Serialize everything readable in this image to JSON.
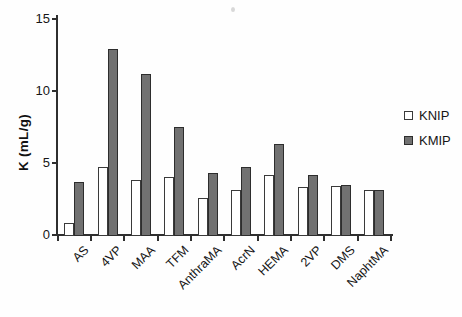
{
  "figure": {
    "background": "#fefefe",
    "kind": "scanned scientific bar chart"
  },
  "colors": {
    "axis": "#2f2f2f",
    "text": "#161616",
    "knip_fill": "#ffffff",
    "knip_border": "#3a3a3a",
    "kmip_fill": "#717171",
    "kmip_border": "#2d2d2d"
  },
  "chart_data": {
    "type": "bar",
    "title": "",
    "xlabel": "",
    "ylabel": "K (mL/g)",
    "ylim": [
      0,
      15
    ],
    "yticks": [
      0,
      5,
      10,
      15
    ],
    "grid": false,
    "legend_position": "right",
    "categories": [
      "AS",
      "4VP",
      "MAA",
      "TFM",
      "AnthraMA",
      "AcrN",
      "HEMA",
      "2VP",
      "DMS",
      "NaphtMA"
    ],
    "series": [
      {
        "name": "KNIP",
        "fill": "#ffffff",
        "border": "#3a3a3a",
        "values": [
          0.8,
          4.7,
          3.8,
          4.0,
          2.6,
          3.1,
          4.2,
          3.3,
          3.4,
          3.1
        ]
      },
      {
        "name": "KMIP",
        "fill": "#717171",
        "border": "#2d2d2d",
        "values": [
          3.7,
          12.9,
          11.2,
          7.5,
          4.3,
          4.7,
          6.3,
          4.2,
          3.5,
          3.1
        ]
      }
    ]
  }
}
